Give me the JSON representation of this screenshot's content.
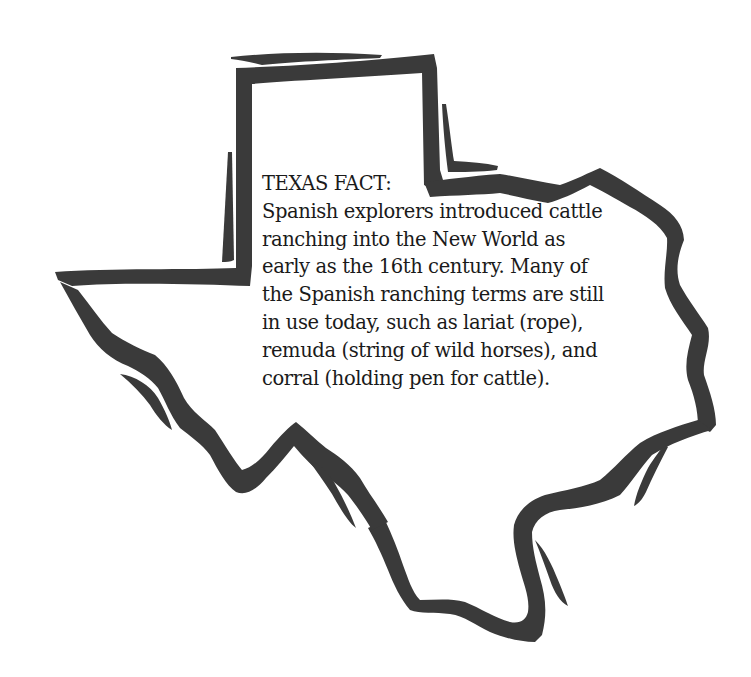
{
  "illustration": {
    "shape": "texas-state-outline",
    "ink_color": "#3a3a3a",
    "background": "#ffffff"
  },
  "fact": {
    "heading": "TEXAS FACT:",
    "lines": [
      "Spanish explorers introduced cattle",
      "ranching into the New World as",
      "early as the 16th century. Many of",
      "the Spanish ranching terms are still",
      "in use today, such as lariat (rope),",
      "remuda (string of wild horses), and",
      "corral (holding pen for cattle)."
    ]
  }
}
